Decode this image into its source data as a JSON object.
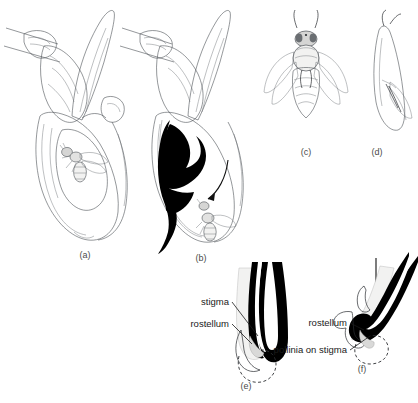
{
  "figure": {
    "background_color": "#ffffff",
    "ink_color": "#4e5257",
    "solid_color": "#000000",
    "label_color": "#1a1a1a",
    "panel_letter_color": "#4a4a4a"
  },
  "panels": [
    {
      "id": "a",
      "letter": "(a)",
      "caption_x": 85,
      "caption_y": 258,
      "subject": "orchid-flower-with-bee-intact",
      "description": "Whole slipper-orchid flower in side view with a bee inside the labellum pouch"
    },
    {
      "id": "b",
      "letter": "(b)",
      "caption_x": 201,
      "caption_y": 261,
      "subject": "orchid-flower-longitudinal-section",
      "description": "Longitudinal section of the same flower; solid black area marks the cavity and the curved arrow shows the bee's exit route"
    },
    {
      "id": "c",
      "letter": "(c)",
      "caption_x": 306,
      "caption_y": 155,
      "subject": "bee-dorsal-view",
      "description": "Dorsal view of the bee carrying pollinia on its thorax"
    },
    {
      "id": "d",
      "letter": "(d)",
      "caption_x": 377,
      "caption_y": 155,
      "subject": "bee-lateral-view",
      "description": "Lateral view of the same bee"
    },
    {
      "id": "e",
      "letter": "(e)",
      "caption_x": 246,
      "caption_y": 389,
      "subject": "column-tip-before-contact",
      "description": "Enlarged hook-shaped column tip, upright, before the bee contacts it"
    },
    {
      "id": "f",
      "letter": "(f)",
      "caption_x": 362,
      "caption_y": 372,
      "subject": "column-tip-after-contact",
      "description": "Enlarged column tip tilted, with arrow showing bee pressure and pollinia deposited on the stigma"
    }
  ],
  "callouts": [
    {
      "id": "stigma-e",
      "panel": "e",
      "text": "stigma",
      "text_x": 229,
      "text_y": 305,
      "anchor": "end"
    },
    {
      "id": "rostellum-e",
      "panel": "e",
      "text": "rostellum",
      "text_x": 229,
      "text_y": 327,
      "anchor": "end"
    },
    {
      "id": "rostellum-f",
      "panel": "f",
      "text": "rostellum",
      "text_x": 347,
      "text_y": 326,
      "anchor": "end"
    },
    {
      "id": "pollinia-on-stigma-f",
      "panel": "f",
      "text": "pollinia on stigma",
      "text_x": 347,
      "text_y": 353,
      "anchor": "end"
    }
  ],
  "arrows": [
    {
      "id": "bee-exit-arrow",
      "panel": "b",
      "style": "curved",
      "direction": "down-left",
      "description": "Curved arrow inside the sectioned flower indicating the bee's escape path past the column"
    },
    {
      "id": "pressure-arrow",
      "panel": "f",
      "style": "straight",
      "direction": "down",
      "description": "Straight vertical arrow above the column tip indicating downward pressure"
    }
  ]
}
